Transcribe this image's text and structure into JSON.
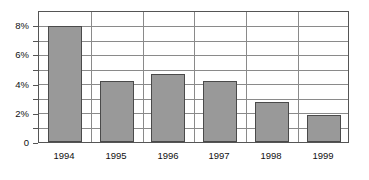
{
  "chart_data": {
    "type": "bar",
    "title": "",
    "xlabel": "",
    "ylabel": "",
    "categories": [
      "1994",
      "1995",
      "1996",
      "1997",
      "1998",
      "1999"
    ],
    "values": [
      8.0,
      4.25,
      4.7,
      4.2,
      2.75,
      1.9
    ],
    "value_labels": [
      "8%",
      "4.25%",
      "4.7%",
      "4.2%",
      "2.75%",
      "1.9%"
    ],
    "ylim": [
      0,
      9
    ],
    "ytick_values": [
      0,
      1,
      2,
      3,
      4,
      5,
      6,
      7,
      8,
      9
    ],
    "ytick_labels": [
      "0",
      "",
      "2%",
      "",
      "4%",
      "",
      "6%",
      "",
      "8%",
      ""
    ],
    "labeled_yticks": [
      {
        "value": 8,
        "label": "8%"
      },
      {
        "value": 6,
        "label": "6%"
      },
      {
        "value": 4,
        "label": "4%"
      },
      {
        "value": 2,
        "label": "2%"
      },
      {
        "value": 0,
        "label": "0"
      }
    ],
    "grid": true,
    "grid_axis": "y",
    "legend": false,
    "legend_position": "none",
    "series": [
      {
        "name": "",
        "values": [
          8.0,
          4.25,
          4.7,
          4.2,
          2.75,
          1.9
        ]
      }
    ],
    "colors": {
      "bar_fill": "#999999",
      "bar_border": "#4a4a4a",
      "gridline": "#8a8a8a",
      "frame": "#555555",
      "background": "#ffffff",
      "text": "#111111"
    }
  }
}
